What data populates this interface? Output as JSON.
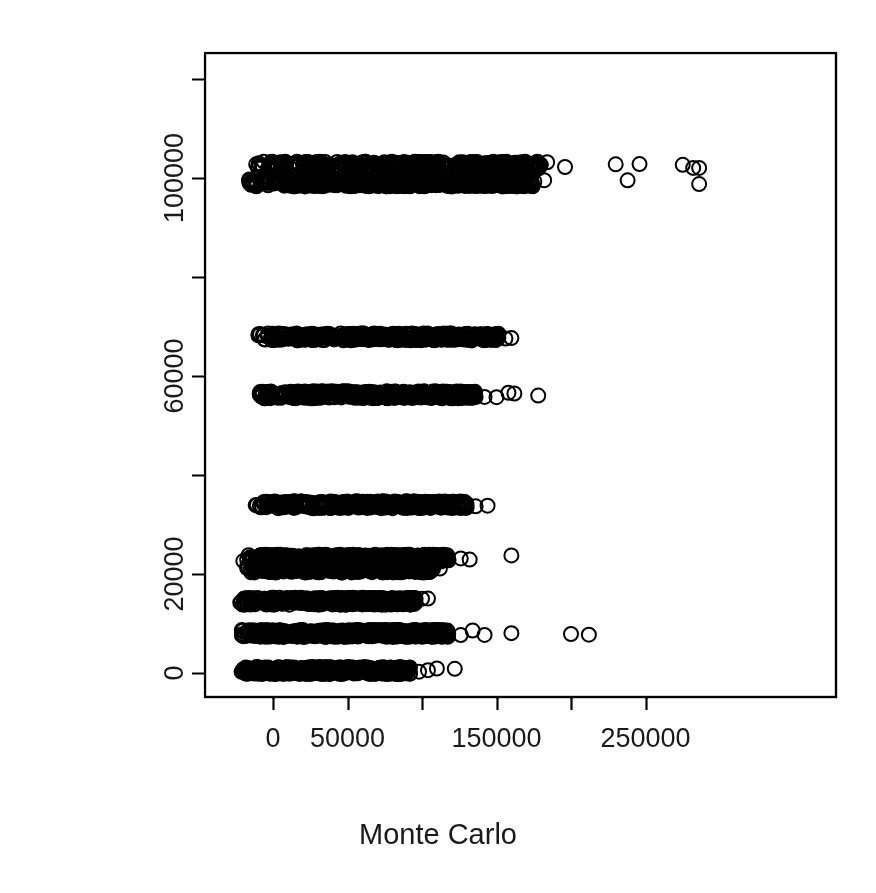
{
  "chart_data": {
    "type": "scatter",
    "title": "",
    "xlabel": "Monte Carlo",
    "ylabel": "Tree model",
    "xlim": [
      -23000,
      285000
    ],
    "ylim": [
      -8000,
      126000
    ],
    "x_ticks": [
      0,
      50000,
      100000,
      150000,
      200000,
      250000
    ],
    "x_tick_labels": [
      "0",
      "50000",
      "",
      "150000",
      "",
      "250000"
    ],
    "y_ticks": [
      0,
      20000,
      40000,
      60000,
      80000,
      100000,
      120000
    ],
    "y_tick_labels": [
      "0",
      "20000",
      "",
      "60000",
      "",
      "100000",
      ""
    ],
    "grid": false,
    "legend": null,
    "point_style": {
      "marker": "open-circle",
      "radius": 7,
      "line_width": 2,
      "color": "#000000",
      "fill": "none"
    },
    "bands": [
      {
        "y": 102600,
        "x_dense_min": -12000,
        "x_dense_max": 180000,
        "n_dense": 420,
        "x_outliers": [
          184000,
          196000,
          230000,
          246000,
          275000,
          282000,
          286000
        ]
      },
      {
        "y": 99000,
        "x_dense_min": -18000,
        "x_dense_max": 176000,
        "n_dense": 520,
        "x_outliers": [
          182000,
          238000,
          286000
        ]
      },
      {
        "y": 67900,
        "x_dense_min": -10000,
        "x_dense_max": 152000,
        "n_dense": 430,
        "x_outliers": [
          156000,
          160000
        ]
      },
      {
        "y": 56200,
        "x_dense_min": -11000,
        "x_dense_max": 136000,
        "n_dense": 460,
        "x_outliers": [
          142000,
          150000,
          158000,
          162000,
          178000
        ]
      },
      {
        "y": 34000,
        "x_dense_min": -12000,
        "x_dense_max": 130000,
        "n_dense": 400,
        "x_outliers": [
          136000,
          144000
        ]
      },
      {
        "y": 23200,
        "x_dense_min": -20000,
        "x_dense_max": 118000,
        "n_dense": 440,
        "x_outliers": [
          126000,
          132000,
          160000
        ]
      },
      {
        "y": 21000,
        "x_dense_min": -19000,
        "x_dense_max": 108000,
        "n_dense": 330,
        "x_outliers": [
          112000
        ]
      },
      {
        "y": 14500,
        "x_dense_min": -22000,
        "x_dense_max": 96000,
        "n_dense": 380,
        "x_outliers": [
          100000,
          104000
        ]
      },
      {
        "y": 8000,
        "x_dense_min": -21000,
        "x_dense_max": 118000,
        "n_dense": 470,
        "x_outliers": [
          126000,
          134000,
          142000,
          160000,
          200000,
          212000
        ]
      },
      {
        "y": 500,
        "x_dense_min": -22000,
        "x_dense_max": 92000,
        "n_dense": 430,
        "x_outliers": [
          98000,
          104000,
          110000,
          122000
        ]
      }
    ]
  },
  "axes": {
    "x_title": "Monte Carlo",
    "y_title": "Tree model"
  },
  "colors": {
    "foreground": "#000000",
    "background": "#ffffff",
    "text": "#1a1a1a"
  }
}
